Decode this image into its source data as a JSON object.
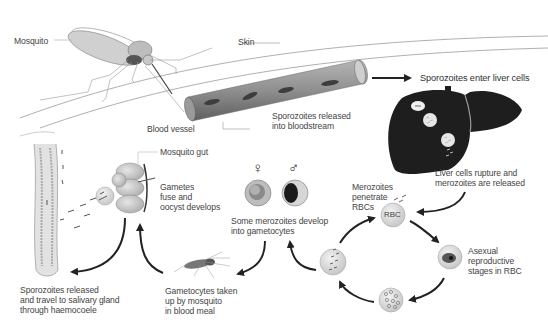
{
  "diagram": {
    "labels": {
      "mosquito": "Mosquito",
      "skin": "Skin",
      "blood_vessel": "Blood vessel",
      "sporozoites_released_bloodstream": "Sporozoites released\ninto bloodstream",
      "sporozoites_enter_liver": "Sporozoites enter liver cells",
      "liver_rupture": "Liver cells rupture and\nmerozoites are released",
      "merozoites_penetrate": "Merozoites\npenetrate\nRBCs",
      "rbc": "RBC",
      "asexual_stages": "Asexual\nreproductive\nstages in RBC",
      "gametocytes_develop": "Some merozoites develop\ninto gametocytes",
      "female_symbol": "♀",
      "male_symbol": "♂",
      "mosquito_gut": "Mosquito gut",
      "gametes_fuse": "Gametes\nfuse and\noocyst develops",
      "sporozoites_salivary": "Sporozoites released\nand travel to salivary gland\nthrough haemocoele",
      "gametocytes_taken_up": "Gametocytes taken\nup by mosquito\nin blood meal"
    },
    "colors": {
      "liver": "#1e1e1e",
      "vessel": "#8a8a8a",
      "cell": "#d8d8d8",
      "arrow": "#222222",
      "text": "#444444"
    }
  }
}
